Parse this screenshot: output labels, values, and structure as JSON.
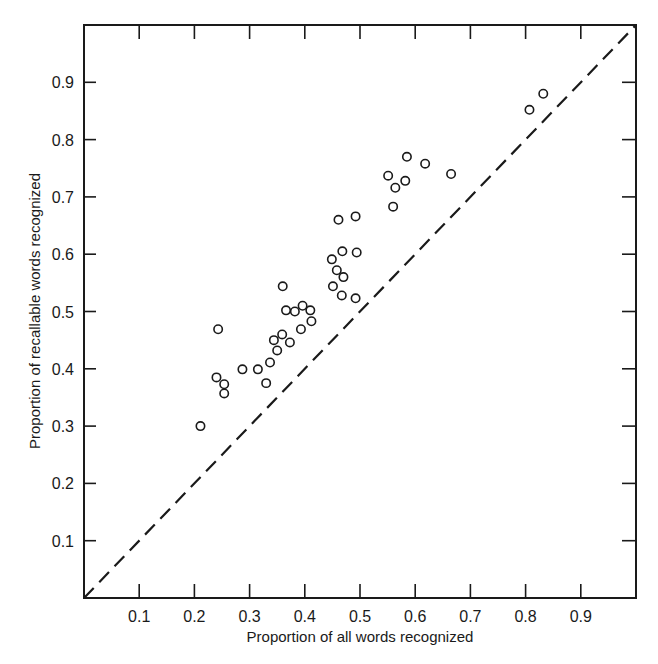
{
  "chart_data": {
    "type": "scatter",
    "title": "",
    "xlabel": "Proportion of all words recognized",
    "ylabel": "Proportion of recallable words recognized",
    "xlim": [
      0,
      1.0
    ],
    "ylim": [
      0,
      1.0
    ],
    "xticks": [
      "0.1",
      "0.2",
      "0.3",
      "0.4",
      "0.5",
      "0.6",
      "0.7",
      "0.8",
      "0.9"
    ],
    "yticks": [
      "0.1",
      "0.2",
      "0.3",
      "0.4",
      "0.5",
      "0.6",
      "0.7",
      "0.8",
      "0.9"
    ],
    "grid": false,
    "legend": null,
    "reference_line": {
      "type": "dashed",
      "label": "y = x",
      "from": [
        0,
        0
      ],
      "to": [
        1,
        1
      ]
    },
    "marker": "open-circle",
    "series": [
      {
        "name": "observations",
        "points": [
          [
            0.211,
            0.3
          ],
          [
            0.24,
            0.385
          ],
          [
            0.243,
            0.469
          ],
          [
            0.254,
            0.373
          ],
          [
            0.254,
            0.357
          ],
          [
            0.287,
            0.399
          ],
          [
            0.315,
            0.399
          ],
          [
            0.33,
            0.375
          ],
          [
            0.337,
            0.411
          ],
          [
            0.344,
            0.45
          ],
          [
            0.35,
            0.432
          ],
          [
            0.359,
            0.46
          ],
          [
            0.36,
            0.544
          ],
          [
            0.366,
            0.502
          ],
          [
            0.373,
            0.446
          ],
          [
            0.382,
            0.5
          ],
          [
            0.393,
            0.469
          ],
          [
            0.396,
            0.51
          ],
          [
            0.41,
            0.502
          ],
          [
            0.412,
            0.483
          ],
          [
            0.449,
            0.591
          ],
          [
            0.451,
            0.544
          ],
          [
            0.458,
            0.572
          ],
          [
            0.461,
            0.66
          ],
          [
            0.467,
            0.528
          ],
          [
            0.468,
            0.605
          ],
          [
            0.47,
            0.56
          ],
          [
            0.492,
            0.666
          ],
          [
            0.492,
            0.523
          ],
          [
            0.494,
            0.603
          ],
          [
            0.551,
            0.737
          ],
          [
            0.56,
            0.683
          ],
          [
            0.564,
            0.716
          ],
          [
            0.582,
            0.728
          ],
          [
            0.585,
            0.77
          ],
          [
            0.618,
            0.758
          ],
          [
            0.665,
            0.74
          ],
          [
            0.807,
            0.852
          ],
          [
            0.832,
            0.88
          ]
        ]
      }
    ]
  },
  "colors": {
    "ink": "#1a1a1a",
    "background": "#ffffff"
  }
}
